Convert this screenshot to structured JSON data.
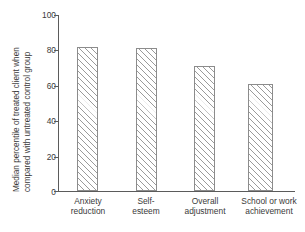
{
  "chart_data": {
    "type": "bar",
    "title": "",
    "xlabel": "",
    "ylabel_line1": "Median percentile of treated client when",
    "ylabel_line2": "compared with untreated control group",
    "categories": [
      "Anxiety reduction",
      "Self- esteem",
      "Overall adjustment",
      "School or work achievement"
    ],
    "category_lines": [
      [
        "Anxiety",
        "reduction"
      ],
      [
        "Self-",
        "esteem"
      ],
      [
        "Overall",
        "adjustment"
      ],
      [
        "School or work",
        "achievement"
      ]
    ],
    "values": [
      82,
      81,
      71,
      61
    ],
    "ylim": [
      0,
      100
    ],
    "yticks": [
      0,
      20,
      40,
      60,
      80,
      100
    ],
    "ytick_labels": [
      "0",
      "20",
      "40",
      "60",
      "80",
      "100"
    ],
    "grid": false,
    "legend": "none",
    "bar_fill": "#ffffff",
    "bar_hatch": "diagonal-forward-slash",
    "bar_edge_color": "#8c8c8c",
    "axis_color": "#5b5b5b",
    "text_color": "#3a3a3a",
    "background": "#ffffff"
  }
}
